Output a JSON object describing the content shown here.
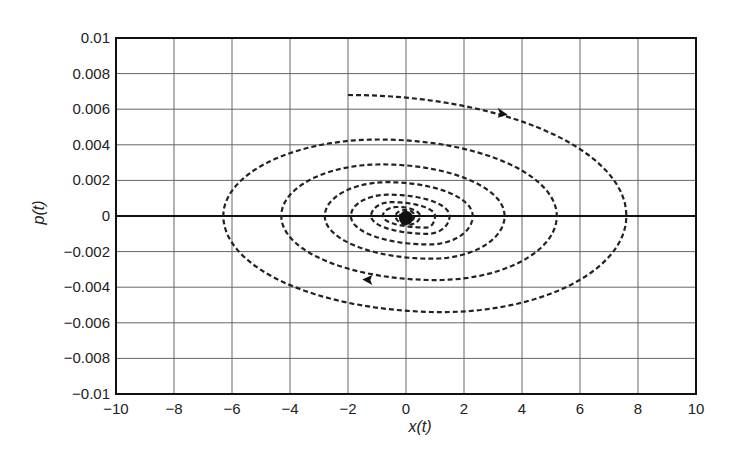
{
  "chart_data": {
    "type": "line",
    "title": "",
    "xlabel": "x(t)",
    "ylabel": "p(t)",
    "xlim": [
      -10,
      10
    ],
    "ylim": [
      -0.01,
      0.01
    ],
    "grid": true,
    "xticks": [
      -10,
      -8,
      -6,
      -4,
      -2,
      0,
      2,
      4,
      6,
      8,
      10
    ],
    "xtick_labels": [
      "−10",
      "−8",
      "−6",
      "−4",
      "−2",
      "0",
      "2",
      "4",
      "6",
      "8",
      "10"
    ],
    "yticks": [
      0.01,
      0.008,
      0.006,
      0.004,
      0.002,
      0,
      -0.002,
      -0.004,
      -0.006,
      -0.008,
      -0.01
    ],
    "ytick_labels": [
      "0.01",
      "0.008",
      "0.006",
      "0.004",
      "0.002",
      "0",
      "−0.002",
      "−0.004",
      "−0.006",
      "−0.008",
      "−0.01"
    ],
    "series": [
      {
        "name": "phase-trajectory",
        "style": "dashed",
        "description": "damped clockwise spiral converging to origin",
        "start": [
          -2,
          0.0068
        ],
        "end": [
          0,
          0
        ],
        "extrema_right_x": [
          7.6,
          5.2,
          3.4,
          2.3,
          1.5,
          1.0
        ],
        "extrema_left_x": [
          -6.3,
          -4.3,
          -2.8,
          -1.9,
          -1.2,
          -0.8
        ],
        "extrema_top_p": [
          0.0068,
          0.0043,
          0.0029,
          0.0019,
          0.0012
        ],
        "extrema_bottom_p": [
          -0.0054,
          -0.0036,
          -0.0024,
          -0.0016,
          -0.001
        ],
        "arrows": [
          {
            "x": 3.3,
            "p": 0.0058,
            "direction": "right"
          },
          {
            "x": -1.3,
            "p": -0.0036,
            "direction": "left"
          }
        ]
      }
    ],
    "equilibrium_point": {
      "x": 0,
      "p": 0,
      "label": ""
    },
    "zero_line": {
      "p": 0
    }
  }
}
